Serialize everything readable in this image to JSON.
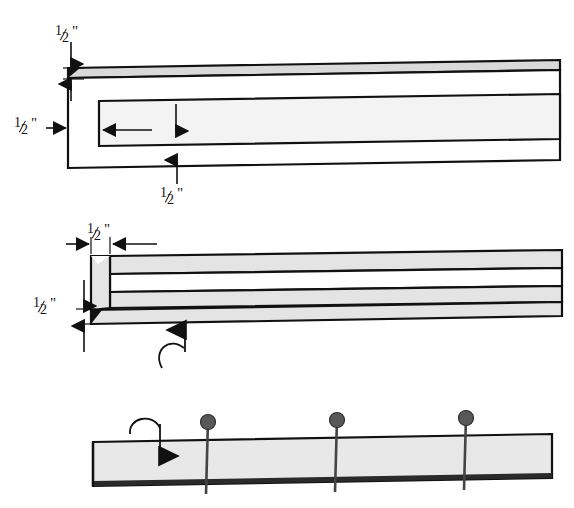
{
  "figure": {
    "background_color": "#ffffff",
    "stroke_color": "#111111",
    "board_fill": "#e8e8e8",
    "board_fill_light": "#f2f2f2",
    "nail_head_color": "#585858",
    "nail_shank_color": "#444444"
  },
  "labels": {
    "top_view": {
      "top_thickness": {
        "numerator": "1",
        "denominator": "2",
        "unit": "\""
      },
      "left_width": {
        "numerator": "1",
        "denominator": "2",
        "unit": "\""
      },
      "bottom_depth": {
        "numerator": "1",
        "denominator": "2",
        "unit": "\""
      }
    },
    "middle_view": {
      "end_width": {
        "numerator": "1",
        "denominator": "2",
        "unit": "\""
      },
      "end_height": {
        "numerator": "1",
        "denominator": "2",
        "unit": "\""
      }
    }
  },
  "views": [
    {
      "name": "top-plan-view",
      "description": "Board end with inner rabbet outline, three half-inch dimension callouts"
    },
    {
      "name": "middle-edge-view",
      "description": "Edge view of board with square end block and fold-over curved arrow"
    },
    {
      "name": "bottom-assembly-view",
      "description": "Assembled board with three nails driven through and curved down arrow"
    }
  ],
  "nails": {
    "count": 3,
    "positions_x": [
      208,
      337,
      466
    ],
    "head_radius": 7
  },
  "artifact_text": "1/2\""
}
